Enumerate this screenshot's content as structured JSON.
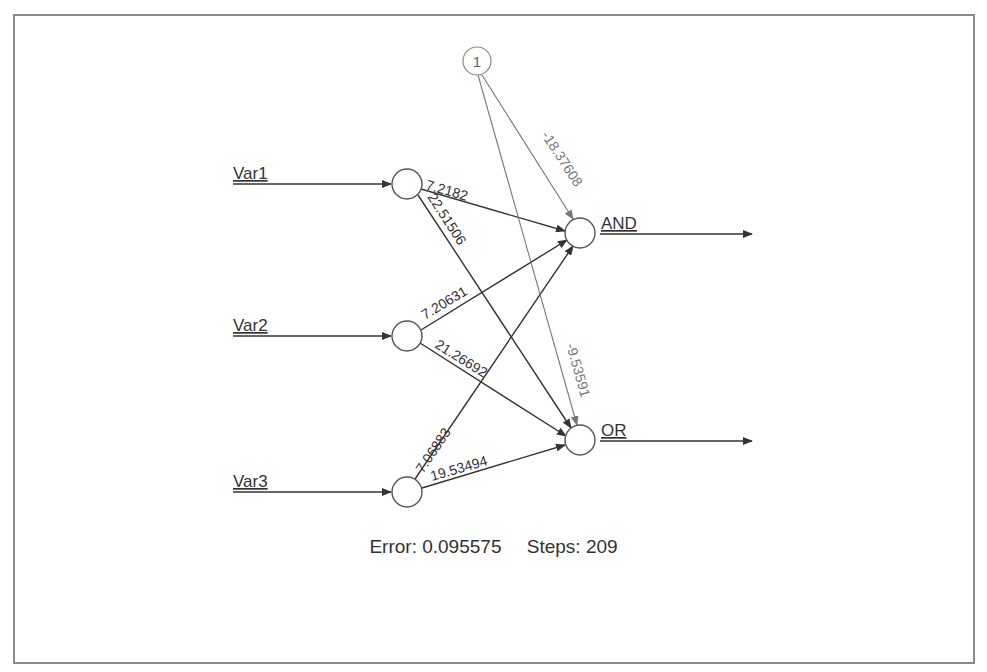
{
  "diagram": {
    "type": "neural-network",
    "inputs": [
      {
        "id": "Var1",
        "label": "Var1",
        "y": 184
      },
      {
        "id": "Var2",
        "label": "Var2",
        "y": 336
      },
      {
        "id": "Var3",
        "label": "Var3",
        "y": 492
      }
    ],
    "outputs": [
      {
        "id": "AND",
        "label": "AND",
        "y": 233
      },
      {
        "id": "OR",
        "label": "OR",
        "y": 440
      }
    ],
    "bias": {
      "label": "1"
    },
    "weights": {
      "var1_and": "7.2182",
      "var1_or": "22.51506",
      "var2_and": "7.20631",
      "var2_or": "21.26692",
      "var3_and": "7.06883",
      "var3_or": "19.53494",
      "bias_and": "-18.37608",
      "bias_or": "-9.53591"
    },
    "colors": {
      "edge": "#333333",
      "bias_edge": "#777777",
      "node_stroke": "#555555",
      "frame": "#8a8a8a"
    }
  },
  "footer": {
    "error_label": "Error: 0.095575",
    "steps_label": "Steps: 209"
  }
}
